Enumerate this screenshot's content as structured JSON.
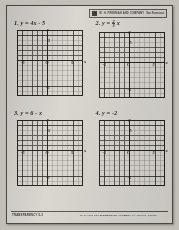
{
  "document": {
    "type": "math-worksheet-transparency",
    "title": "Graphing Linear Equations Transparency"
  },
  "header": {
    "logo_icon": "publisher-logo-icon",
    "credit_line_1": "W. H. FREEMAN AND COMPANY",
    "credit_line_2": "San Francisco"
  },
  "problems": [
    {
      "number": "1.",
      "equation_text": "y = 4x - 5",
      "equation_parts": {
        "lhs": "y",
        "eq": "=",
        "rhs": "4x - 5"
      },
      "has_fraction": false,
      "axis_labels": {
        "x": "x",
        "y": "y",
        "origin": "O"
      },
      "tick_labels": {
        "x_neg": "-5",
        "x_pos": "5",
        "y_pos": "5",
        "y_neg": "-5"
      }
    },
    {
      "number": "2.",
      "equation_text": "y = 2/3 x",
      "equation_parts": {
        "lhs": "y",
        "eq": "=",
        "rhs": "x"
      },
      "has_fraction": true,
      "fraction": {
        "numerator": "2",
        "denominator": "3"
      },
      "axis_labels": {
        "x": "x",
        "y": "y",
        "origin": "O"
      },
      "tick_labels": {
        "x_neg": "-5",
        "x_pos": "5",
        "y_pos": "5",
        "y_neg": "-5"
      }
    },
    {
      "number": "3.",
      "equation_text": "y = 6 - x",
      "equation_parts": {
        "lhs": "y",
        "eq": "=",
        "rhs": "6 - x"
      },
      "has_fraction": false,
      "axis_labels": {
        "x": "x",
        "y": "y",
        "origin": "O"
      },
      "tick_labels": {
        "x_neg": "-5",
        "x_pos": "5",
        "y_pos": "5",
        "y_neg": "-5"
      }
    },
    {
      "number": "4.",
      "equation_text": "y = -2",
      "equation_parts": {
        "lhs": "y",
        "eq": "=",
        "rhs": "-2"
      },
      "has_fraction": false,
      "axis_labels": {
        "x": "x",
        "y": "y",
        "origin": "O"
      },
      "tick_labels": {
        "x_neg": "-5",
        "x_pos": "5",
        "y_pos": "5",
        "y_neg": "-5"
      }
    }
  ],
  "grid": {
    "cells_x": 13,
    "cells_y": 13,
    "x_min": -6,
    "x_max": 7,
    "y_min": -6,
    "y_max": 7,
    "axis_color": "#1f1e1b",
    "grid_color": "#5d5a55"
  },
  "footer": {
    "left_label": "TRANSPARENCY 5-3",
    "right_label_prefix": "To be used with ",
    "right_label_title": "ELEMENTARY ALGEBRA",
    "right_label_suffix": " by Harold R. Jacobs"
  },
  "colors": {
    "paper": "#d8d5cf",
    "scan_background": "#c2bfb9",
    "ink": "#1f1e1b",
    "border": "#4a4843"
  }
}
